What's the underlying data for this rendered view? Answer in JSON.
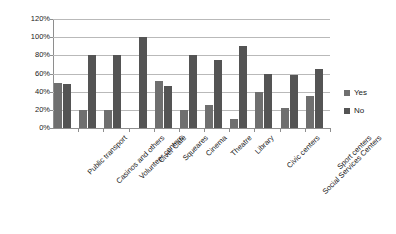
{
  "chart_data": {
    "type": "bar",
    "title": "",
    "subtitle": "",
    "xlabel": "",
    "ylabel": "",
    "ylim": [
      0,
      120
    ],
    "ytick_labels": [
      "0%",
      "20%",
      "40%",
      "60%",
      "80%",
      "100%",
      "120%"
    ],
    "ytick_values": [
      0,
      20,
      40,
      60,
      80,
      100,
      120
    ],
    "grid": true,
    "legend_position": "right",
    "categories": [
      "Public transport",
      "Casinos and others",
      "Volunteer centers",
      "Civer Café",
      "Squeares",
      "Cinema",
      "Theatre",
      "Library",
      "Civic centers",
      "Social Services Centers",
      "Sport centers"
    ],
    "series": [
      {
        "name": "Yes",
        "color": "#6f6f6f",
        "values": [
          50,
          20,
          20,
          0,
          52,
          20,
          25,
          10,
          40,
          22,
          35
        ]
      },
      {
        "name": "No",
        "color": "#545454",
        "values": [
          48,
          80,
          80,
          100,
          46,
          80,
          75,
          90,
          60,
          58,
          65
        ]
      }
    ]
  },
  "legend": {
    "items": [
      {
        "label": "Yes"
      },
      {
        "label": "No"
      }
    ]
  }
}
